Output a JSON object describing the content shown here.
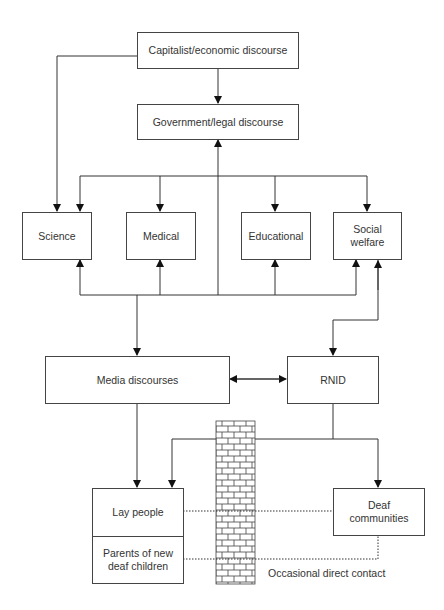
{
  "diagram": {
    "nodes": {
      "capitalist": "Capitalist/economic discourse",
      "government": "Government/legal discourse",
      "science": "Science",
      "medical": "Medical",
      "educational": "Educational",
      "social_welfare": "Social welfare",
      "media": "Media discourses",
      "rnid": "RNID",
      "lay_people": "Lay people",
      "parents": "Parents of new deaf children",
      "deaf_communities": "Deaf communities"
    },
    "annotations": {
      "contact": "Occasional direct contact"
    },
    "edges": [
      {
        "from": "capitalist",
        "to": "government"
      },
      {
        "from": "capitalist",
        "to": "science"
      },
      {
        "from": "government",
        "to": [
          "science",
          "medical",
          "educational",
          "social_welfare"
        ]
      },
      {
        "from": "media",
        "to": [
          "government",
          "science",
          "medical",
          "educational",
          "social_welfare"
        ]
      },
      {
        "from": "social_welfare",
        "to": "rnid"
      },
      {
        "from": "media",
        "to": "rnid",
        "bidirectional": true
      },
      {
        "from": "media",
        "to": "lay_people"
      },
      {
        "from": "rnid",
        "to": [
          "lay_people",
          "deaf_communities"
        ]
      },
      {
        "from": "lay_people",
        "to": "deaf_communities",
        "style": "dotted"
      },
      {
        "from": "parents",
        "to": "deaf_communities",
        "style": "dotted"
      }
    ],
    "barrier": "brick-wall"
  }
}
